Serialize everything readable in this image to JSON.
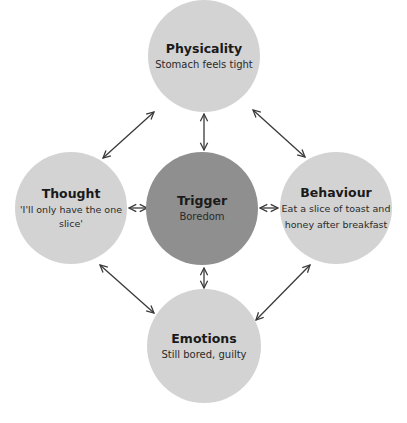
{
  "colors": {
    "outer_node": "#d3d3d3",
    "center_node": "#8f8f8f",
    "arrow": "#3a3a3a",
    "background": "#ffffff"
  },
  "nodes": {
    "physicality": {
      "title": "Physicality",
      "text": "Stomach feels tight"
    },
    "thought": {
      "title": "Thought",
      "text": "'I'll only have the one slice'"
    },
    "trigger": {
      "title": "Trigger",
      "text": "Boredom"
    },
    "behaviour": {
      "title": "Behaviour",
      "text_line1": "Eat a slice of toast and",
      "text_line2": "honey after breakfast"
    },
    "emotions": {
      "title": "Emotions",
      "text": "Still bored, guilty"
    }
  },
  "arrows": [
    {
      "from": "thought",
      "to": "physicality",
      "type": "bidirectional"
    },
    {
      "from": "physicality",
      "to": "behaviour",
      "type": "bidirectional"
    },
    {
      "from": "thought",
      "to": "emotions",
      "type": "bidirectional"
    },
    {
      "from": "behaviour",
      "to": "emotions",
      "type": "bidirectional"
    },
    {
      "from": "trigger",
      "to": "physicality",
      "type": "bidirectional"
    },
    {
      "from": "trigger",
      "to": "thought",
      "type": "bidirectional"
    },
    {
      "from": "trigger",
      "to": "behaviour",
      "type": "bidirectional"
    },
    {
      "from": "trigger",
      "to": "emotions",
      "type": "bidirectional"
    }
  ]
}
